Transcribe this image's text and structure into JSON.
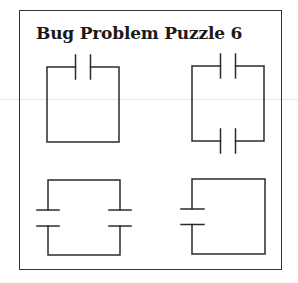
{
  "title": "Bug Problem Puzzle 6",
  "colors": {
    "line": "#2b2b2b",
    "background": "#ffffff",
    "frame": "#333333"
  },
  "circuits": [
    {
      "id": 1,
      "description": "Loop with one capacitor on the top wire",
      "capacitors": 1,
      "orientation": "vertical plates, top side"
    },
    {
      "id": 2,
      "description": "Loop with two capacitors: one on the top wire and one on the bottom wire",
      "capacitors": 2,
      "orientation": "vertical plates, top and bottom sides"
    },
    {
      "id": 3,
      "description": "Loop with two capacitors: one on the left wire and one on the right wire",
      "capacitors": 2,
      "orientation": "horizontal plates, left and right sides"
    },
    {
      "id": 4,
      "description": "Loop with one capacitor on the left wire",
      "capacitors": 1,
      "orientation": "horizontal plates, left side"
    }
  ]
}
